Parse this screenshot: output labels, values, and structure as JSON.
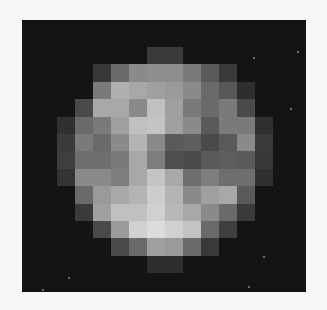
{
  "image": {
    "description": "Pixelated grayscale image of a planetary body on a dark background",
    "background_color": "#141414",
    "page_color": "#f7f7f7",
    "grid_columns": 12,
    "grid_rows": 13,
    "pixels": [
      [
        "",
        "",
        "",
        "",
        "",
        "#3a3a3a",
        "#3a3a3a",
        "",
        "",
        "",
        "",
        ""
      ],
      [
        "",
        "",
        "#383838",
        "#6a6a6a",
        "#8a8a8a",
        "#8e8e8e",
        "#8e8e8e",
        "#7a7a7a",
        "#5a5a5a",
        "#3a3a3a",
        "",
        ""
      ],
      [
        "",
        "",
        "#7a7a7a",
        "#b0b0b0",
        "#a8a8a8",
        "#a0a0a0",
        "#9a9a9a",
        "#8a8a8a",
        "#6a6a6a",
        "#585858",
        "#2e2e2e",
        ""
      ],
      [
        "",
        "#4a4a4a",
        "#a8a8a8",
        "#a8a8a8",
        "#8a8a8a",
        "#c0c0c0",
        "#a0a0a0",
        "#7a7a7a",
        "#6a6a6a",
        "#7a7a7a",
        "#4a4a4a",
        ""
      ],
      [
        "#303030",
        "#6a6a6a",
        "#7a7a7a",
        "#a0a0a0",
        "#c0c0c0",
        "#c4c4c4",
        "#a0a0a0",
        "#8a8a8a",
        "#5a5a5a",
        "#7a7a7a",
        "#7a7a7a",
        "#303030"
      ],
      [
        "#3a3a3a",
        "#7a7a7a",
        "#6a6a6a",
        "#8a8a8a",
        "#b4b4b4",
        "#8a8a8a",
        "#5a5a5a",
        "#5e5e5e",
        "#4a4a4a",
        "#5a5a5a",
        "#8a8a8a",
        "#3a3a3a"
      ],
      [
        "#3e3e3e",
        "#6e6e6e",
        "#6e6e6e",
        "#7a7a7a",
        "#a8a8a8",
        "#7e7e7e",
        "#4e4e4e",
        "#4a4a4a",
        "#5a5a5a",
        "#5e5e5e",
        "#5a5a5a",
        "#383838"
      ],
      [
        "#343434",
        "#8a8a8a",
        "#8a8a8a",
        "#7e7e7e",
        "#a8a8a8",
        "#c4c4c4",
        "#a8a8a8",
        "#6e6e6e",
        "#7e7e7e",
        "#6e6e6e",
        "#6e6e6e",
        "#303030"
      ],
      [
        "",
        "#6a6a6a",
        "#9a9a9a",
        "#a8a8a8",
        "#b4b4b4",
        "#cccccc",
        "#b4b4b4",
        "#8a8a8a",
        "#a0a0a0",
        "#a8a8a8",
        "#5a5a5a",
        ""
      ],
      [
        "",
        "#3a3a3a",
        "#a0a0a0",
        "#c0c0c0",
        "#c0c0c0",
        "#d0d0d0",
        "#b8b8b8",
        "#a8a8a8",
        "#8a8a8a",
        "#6a6a6a",
        "#3a3a3a",
        ""
      ],
      [
        "",
        "",
        "#4a4a4a",
        "#9a9a9a",
        "#d0d0d0",
        "#dcdcdc",
        "#d0d0d0",
        "#c4c4c4",
        "#6a6a6a",
        "#3e3e3e",
        "",
        ""
      ],
      [
        "",
        "",
        "",
        "#4a4a4a",
        "#6a6a6a",
        "#a0a0a0",
        "#9a9a9a",
        "#6a6a6a",
        "#3a3a3a",
        "",
        "",
        ""
      ],
      [
        "",
        "",
        "",
        "",
        "",
        "#2e2e2e",
        "#2e2e2e",
        "",
        "",
        "",
        "",
        ""
      ]
    ],
    "stars": [
      {
        "x": 297,
        "y": 51
      },
      {
        "x": 253,
        "y": 57
      },
      {
        "x": 290,
        "y": 108
      },
      {
        "x": 263,
        "y": 256
      },
      {
        "x": 248,
        "y": 286
      },
      {
        "x": 42,
        "y": 289
      },
      {
        "x": 68,
        "y": 277
      }
    ]
  }
}
